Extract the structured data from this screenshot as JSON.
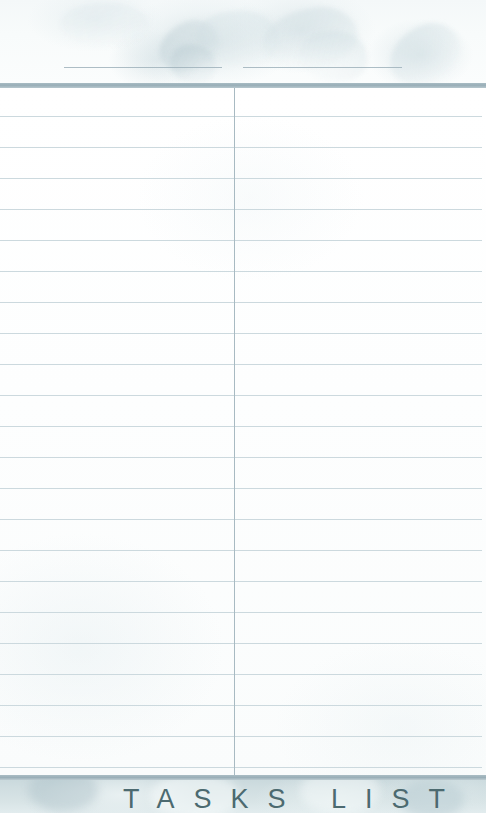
{
  "page": {
    "title": "TASKS LIST",
    "kind": "lined-notepad-page"
  },
  "header": {
    "name_line_left": "",
    "name_line_right": "",
    "watermark": "floral-watermark"
  },
  "body": {
    "line_count": 22,
    "line_spacing_px": 31,
    "column_divider_x": 234
  },
  "footer": {
    "title": "TASKS LIST"
  },
  "colors": {
    "rule_line": "#ccd9de",
    "divider_bar": "#98aeb7",
    "vertical_divider": "#a8bac2",
    "header_rule": "#9fb2bb",
    "title_text": "#4c6a70",
    "paper": "#fdfefe",
    "footer_band": "#cfdde0"
  }
}
